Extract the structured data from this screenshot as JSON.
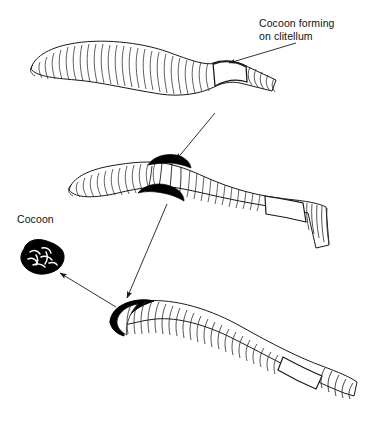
{
  "figure": {
    "title_visible": false,
    "background_color": "#ffffff",
    "ink_color": "#1a1a1a",
    "fill_black": "#000000",
    "stage_count": 3
  },
  "labels": {
    "cocoon_forming": {
      "line1": "Cocoon forming",
      "line2": "on clitellum"
    },
    "cocoon": "Cocoon"
  },
  "annotations": [
    {
      "name": "leader-cocoon-forming",
      "from": [
        296,
        42
      ],
      "to": [
        225,
        64
      ],
      "kind": "leader-arrow"
    },
    {
      "name": "flow-arrow-stage1-to-stage2",
      "from": [
        214,
        114
      ],
      "to": [
        175,
        161
      ],
      "kind": "flow-arrow"
    },
    {
      "name": "flow-arrow-stage2-to-stage3",
      "from": [
        166,
        203
      ],
      "to": [
        126,
        299
      ],
      "kind": "flow-arrow"
    },
    {
      "name": "flow-arrow-stage3-to-cocoon",
      "from": [
        115,
        306
      ],
      "to": [
        57,
        272
      ],
      "kind": "flow-arrow"
    }
  ],
  "stages": [
    {
      "id": "stage-1",
      "name": "worm-stage-1-cocoon-forming",
      "description": "Cocoon forming on clitellum",
      "clitellum_state": "smooth-swollen-band",
      "cocoon_color": "#ffffff"
    },
    {
      "id": "stage-2",
      "name": "worm-stage-2-cocoon-band",
      "description": "Cocoon slipping forward over body",
      "clitellum_state": "black-band",
      "cocoon_color": "#000000"
    },
    {
      "id": "stage-3",
      "name": "worm-stage-3-cocoon-at-head",
      "description": "Cocoon sliding off anterior end",
      "clitellum_state": "black-ring-at-head",
      "cocoon_color": "#000000"
    }
  ],
  "cocoon_object": {
    "name": "detached-cocoon",
    "fill": "#000000",
    "description": "Irregular dark blob with pale internal markings"
  }
}
